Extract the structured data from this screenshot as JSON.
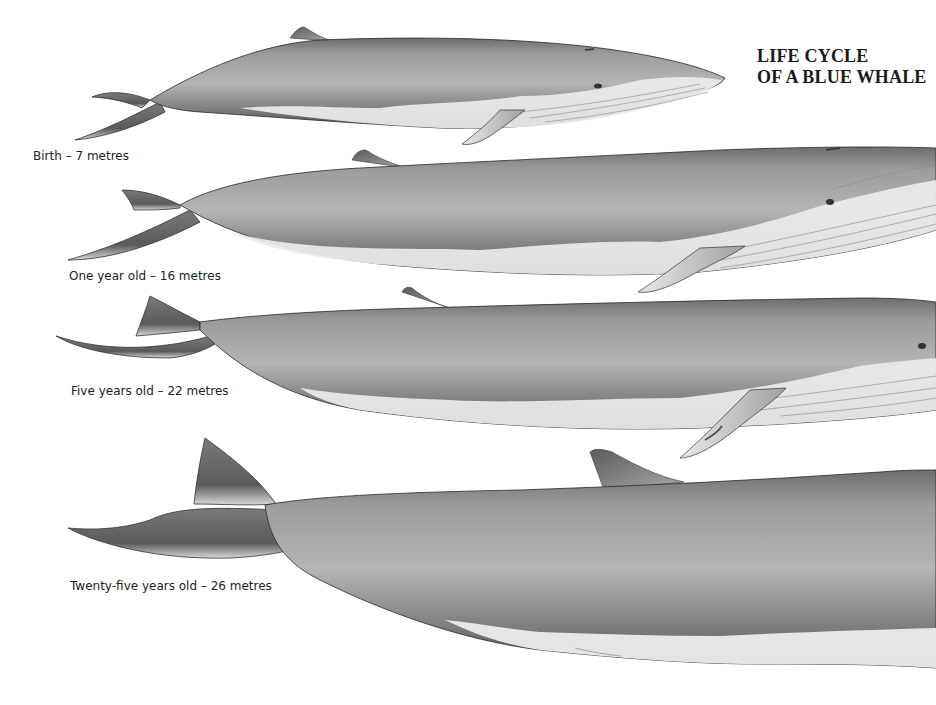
{
  "title": {
    "line1": "LIFE CYCLE",
    "line2": "OF A BLUE WHALE"
  },
  "stages": [
    {
      "label": "Birth – 7 metres",
      "age": "Birth",
      "length_m": 7
    },
    {
      "label": "One year old – 16 metres",
      "age": "One year old",
      "length_m": 16
    },
    {
      "label": "Five years old – 22 metres",
      "age": "Five years old",
      "length_m": 22
    },
    {
      "label": "Twenty-five years old – 26 metres",
      "age": "Twenty-five years old",
      "length_m": 26
    }
  ],
  "colors": {
    "background": "#ffffff",
    "body_dark": "#5a5a5a",
    "body_mid": "#9a9a9a",
    "body_light": "#cfcfcf",
    "belly": "#ededed",
    "outline": "#2a2a2a",
    "text": "#222222"
  }
}
